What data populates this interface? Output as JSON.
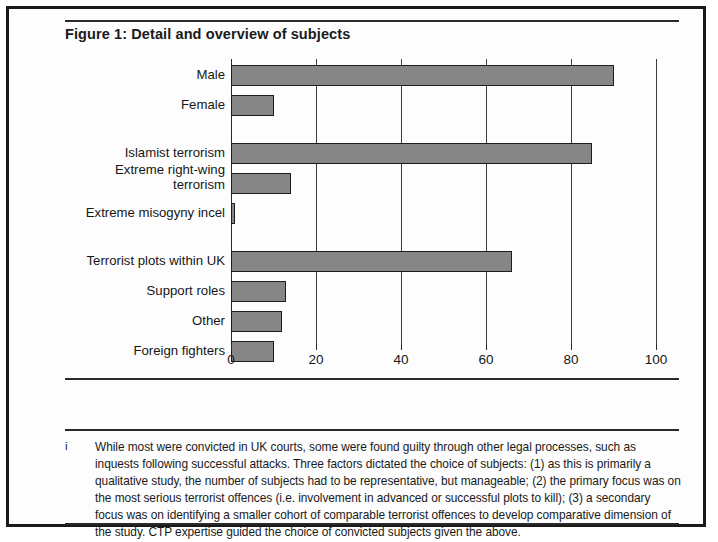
{
  "figure": {
    "title": "Figure 1: Detail and overview of subjects",
    "footnote_marker": "i",
    "footnote_text": "While most were convicted in UK courts, some were found guilty through other legal processes, such as inquests following successful attacks. Three factors dictated the choice of subjects: (1) as this is primarily a qualitative study, the number of subjects had to be representative, but manageable; (2) the primary focus was on the most serious terrorist offences (i.e. involvement in advanced or successful plots to kill); (3) a secondary focus was on identifying a smaller cohort of comparable terrorist offences to develop comparative dimension of the study. CTP expertise guided the choice of convicted subjects given the above."
  },
  "colors": {
    "bar_fill": "#868686",
    "bar_stroke": "#1d1d1d",
    "frame": "#1a1a1a",
    "text": "#161616"
  },
  "chart_data": {
    "type": "bar",
    "orientation": "horizontal",
    "title": "Figure 1: Detail and overview of subjects",
    "xlabel": "",
    "ylabel": "",
    "xlim": [
      0,
      100
    ],
    "grid": true,
    "grid_axis": "x",
    "legend": "none",
    "xticks": [
      0,
      20,
      40,
      60,
      80,
      100
    ],
    "xtick_labels": [
      "0",
      "20",
      "40",
      "60",
      "80",
      "100"
    ],
    "groups": [
      {
        "name": "Gender",
        "categories": [
          "Male",
          "Female"
        ],
        "values": [
          90,
          10
        ]
      },
      {
        "name": "Ideology",
        "categories": [
          "Islamist terrorism",
          "Extreme right-wing\nterrorism",
          "Extreme misogyny incel"
        ],
        "values": [
          85,
          14,
          1
        ]
      },
      {
        "name": "Offence type",
        "categories": [
          "Terrorist plots within UK",
          "Support roles",
          "Other",
          "Foreign fighters"
        ],
        "values": [
          66,
          13,
          12,
          10
        ]
      }
    ],
    "categories": [
      "Male",
      "Female",
      "Islamist terrorism",
      "Extreme right-wing terrorism",
      "Extreme misogyny incel",
      "Terrorist plots within UK",
      "Support roles",
      "Other",
      "Foreign fighters"
    ],
    "values": [
      90,
      10,
      85,
      14,
      1,
      66,
      13,
      12,
      10
    ]
  },
  "layout": {
    "rows": [
      {
        "label": "Male",
        "value": 90,
        "top": 6,
        "label_lines": 1
      },
      {
        "label": "Female",
        "value": 10,
        "top": 36,
        "label_lines": 1
      },
      {
        "label": "Islamist terrorism",
        "value": 85,
        "top": 84,
        "label_lines": 1
      },
      {
        "label": "Extreme right-wing\nterrorism",
        "value": 14,
        "top": 114,
        "label_lines": 2
      },
      {
        "label": "Extreme misogyny incel",
        "value": 1,
        "top": 144,
        "label_lines": 1
      },
      {
        "label": "Terrorist plots within UK",
        "value": 66,
        "top": 192,
        "label_lines": 1
      },
      {
        "label": "Support roles",
        "value": 13,
        "top": 222,
        "label_lines": 1
      },
      {
        "label": "Other",
        "value": 12,
        "top": 252,
        "label_lines": 1
      },
      {
        "label": "Foreign fighters",
        "value": 10,
        "top": 282,
        "label_lines": 1
      }
    ]
  }
}
